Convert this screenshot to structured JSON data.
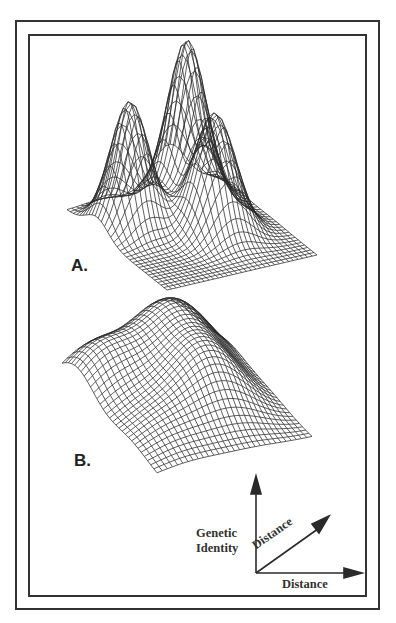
{
  "figure": {
    "panels": [
      {
        "id": "A",
        "label": "A.",
        "description": "Three sharp peaks of genetic identity on a flat plane"
      },
      {
        "id": "B",
        "label": "B.",
        "description": "Gently undulating surface of genetic identity"
      }
    ],
    "axes": {
      "vertical_label_line1": "Genetic",
      "vertical_label_line2": "Identity",
      "diagonal_label": "Distance",
      "horizontal_label": "Distance"
    }
  },
  "chart_data": {
    "type": "surface",
    "title": "",
    "axes": {
      "z": "Genetic Identity",
      "x": "Distance",
      "y": "Distance"
    },
    "panels": [
      {
        "label": "A.",
        "peaks": [
          {
            "name": "left",
            "relative_height": 0.78
          },
          {
            "name": "back",
            "relative_height": 1.0
          },
          {
            "name": "right",
            "relative_height": 0.74
          }
        ],
        "baseline": "flat"
      },
      {
        "label": "B.",
        "shape": "broad low undulating hills",
        "relative_amplitude": 0.25
      }
    ]
  },
  "colors": {
    "line": "#2a2a2a",
    "background": "#ffffff"
  }
}
